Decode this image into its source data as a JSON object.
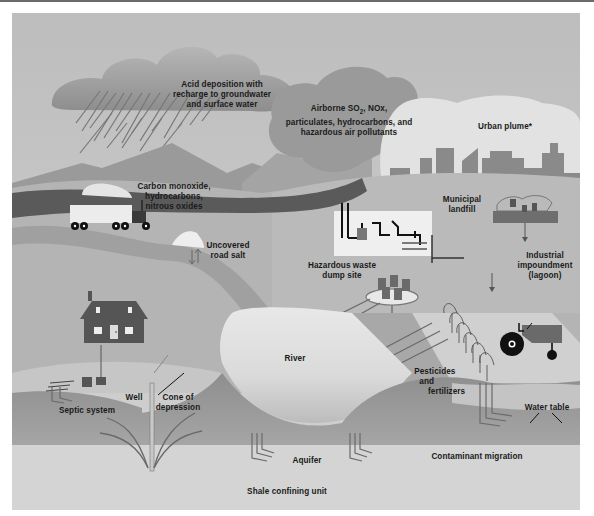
{
  "figure": {
    "style": "grayscale illustrated cross-section",
    "colors": {
      "sky": "#c4c4c4",
      "cloud_dark": "#8f8f8f",
      "cloud_light": "#e6e6e6",
      "road": "#5a5a5a",
      "buildings": "#8a8a8a",
      "ground": "#b0b0b0",
      "aquifer": "#9c9c9c",
      "shale": "#d0d0d0",
      "text": "#1a1a1a"
    }
  },
  "labels": {
    "acid_deposition": [
      "Acid deposition with",
      "recharge to groundwater",
      "and surface water"
    ],
    "airborne": [
      "Airborne SO",
      "2",
      ", NOx,",
      "particulates, hydrocarbons, and",
      "hazardous air pollutants"
    ],
    "urban_plume": "Urban plume*",
    "vehicle_emissions": [
      "Carbon monoxide,",
      "hydrocarbons,",
      "nitrous oxides"
    ],
    "municipal_landfill": [
      "Municipal",
      "landfill"
    ],
    "road_salt": [
      "Uncovered",
      "road salt"
    ],
    "industrial_impoundment": [
      "Industrial",
      "impoundment",
      "(lagoon)"
    ],
    "hazardous_waste": [
      "Hazardous waste",
      "dump site"
    ],
    "river": "River",
    "pesticides": [
      "Pesticides",
      "and",
      "fertilizers"
    ],
    "well": "Well",
    "cone": [
      "Cone of",
      "depression"
    ],
    "septic": "Septic system",
    "water_table": "Water table",
    "aquifer": "Aquifer",
    "contaminant_migration": "Contaminant migration",
    "shale": "Shale confining unit"
  },
  "elements": {
    "house": "house",
    "truck": "truck",
    "factory": "factory",
    "tractor": "tractor",
    "cornfield": "crops",
    "barrels": "waste-barrels",
    "city": "city-skyline"
  }
}
